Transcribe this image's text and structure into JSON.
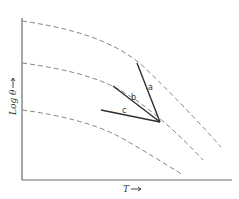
{
  "diagram": {
    "x_axis_label": "T",
    "y_axis_label": "Log θ",
    "x_axis_direction": "increasing-right",
    "y_axis_direction": "increasing-up",
    "curves": [
      {
        "id": "curve-1",
        "style": "dashed",
        "description": "upper dashed curve, decreasing with T"
      },
      {
        "id": "curve-2",
        "style": "dashed",
        "description": "middle dashed curve, decreasing with T"
      },
      {
        "id": "curve-3",
        "style": "dashed",
        "description": "lower dashed curve, decreasing with T"
      }
    ],
    "lines": [
      {
        "label": "a",
        "style": "solid",
        "description": "steepest line, converging at common point"
      },
      {
        "label": "b",
        "style": "solid",
        "description": "intermediate slope line, converging at common point"
      },
      {
        "label": "c",
        "style": "solid",
        "description": "shallowest line, converging at common point"
      }
    ]
  }
}
